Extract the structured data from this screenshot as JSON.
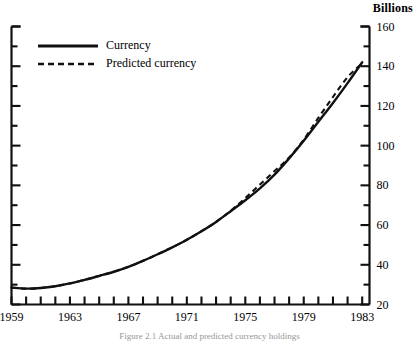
{
  "figure": {
    "unit_label": "Billions",
    "caption": "Figure 2.1  Actual and predicted currency holdings",
    "ink_color": "#111111",
    "background": "#ffffff"
  },
  "legend": {
    "position": "top-left",
    "entries": [
      {
        "label": "Currency",
        "style": "solid"
      },
      {
        "label": "Predicted currency",
        "style": "dashed"
      }
    ]
  },
  "axes": {
    "y_labels": [
      "160",
      "140",
      "120",
      "100",
      "80",
      "60",
      "40",
      "20"
    ],
    "x_labels": [
      "1959",
      "1963",
      "1967",
      "1971",
      "1975",
      "1979",
      "1983"
    ]
  },
  "chart_data": {
    "type": "line",
    "title": "",
    "subtitle": "",
    "xlabel": "",
    "ylabel": "Billions",
    "xlim": [
      1959,
      1983.5
    ],
    "ylim": [
      20,
      160
    ],
    "ytick_step": 20,
    "yminor_step": 10,
    "xtick_step": 1,
    "xlabel_step": 4,
    "grid": false,
    "legend_position": "top-left",
    "x": [
      1959,
      1960,
      1961,
      1962,
      1963,
      1964,
      1965,
      1966,
      1967,
      1968,
      1969,
      1970,
      1971,
      1972,
      1973,
      1974,
      1975,
      1976,
      1977,
      1978,
      1979,
      1980,
      1981,
      1982,
      1983
    ],
    "series": [
      {
        "name": "Currency",
        "style": "solid",
        "values": [
          28.5,
          28.0,
          28.3,
          29.2,
          30.6,
          32.4,
          34.4,
          36.5,
          39.0,
          42.0,
          45.3,
          48.8,
          52.6,
          56.9,
          61.6,
          67.0,
          72.5,
          78.5,
          85.4,
          93.6,
          102.5,
          112.0,
          121.5,
          131.5,
          142.0
        ]
      },
      {
        "name": "Predicted currency",
        "style": "dashed",
        "values": [
          28.5,
          28.0,
          28.3,
          29.2,
          30.6,
          32.4,
          34.4,
          36.5,
          39.0,
          42.0,
          45.3,
          48.8,
          52.6,
          56.9,
          61.6,
          67.2,
          73.6,
          80.4,
          87.2,
          94.0,
          103.0,
          114.0,
          124.5,
          134.5,
          141.5
        ]
      }
    ]
  }
}
